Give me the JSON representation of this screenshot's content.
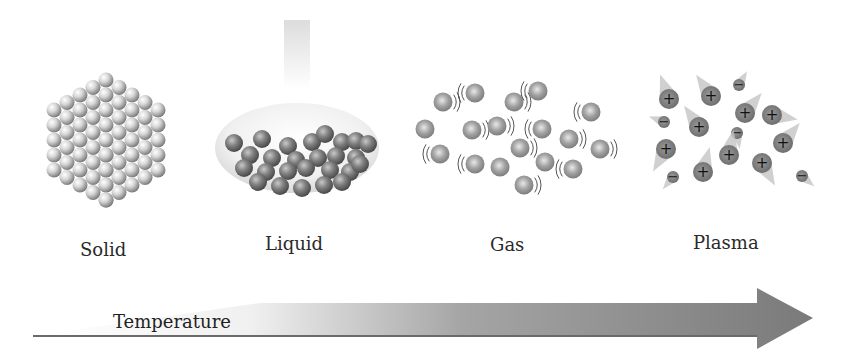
{
  "diagram": {
    "states": [
      {
        "id": "solid",
        "label": "Solid"
      },
      {
        "id": "liquid",
        "label": "Liquid"
      },
      {
        "id": "gas",
        "label": "Gas"
      },
      {
        "id": "plasma",
        "label": "Plasma"
      }
    ],
    "arrow": {
      "label": "Temperature",
      "direction": "increasing-right"
    },
    "plasma_symbols": {
      "positive": "+",
      "negative": "−"
    },
    "colors": {
      "solid_sphere": "#d0d0d0",
      "liquid_sphere": "#7a7a7a",
      "gas_sphere": "#9a9a9a",
      "plasma_ion": "#7f7f7f",
      "arrow_dark": "#7b7b7b",
      "arrow_light": "#ffffff"
    }
  }
}
